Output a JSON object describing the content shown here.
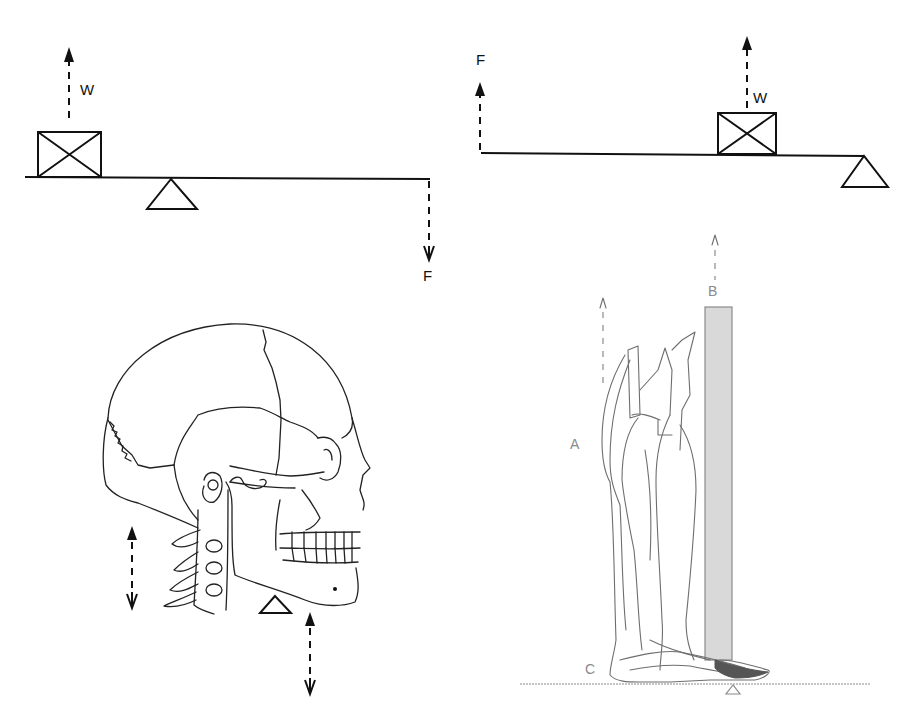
{
  "lever_first_class": {
    "title": "First-class lever",
    "load_label": "W",
    "effort_label": "F",
    "load_arrow": "up",
    "effort_arrow": "down",
    "fulcrum": "between load and effort"
  },
  "lever_second_class": {
    "title": "Second-class lever",
    "effort_label": "F",
    "load_label": "W",
    "effort_arrow": "up",
    "load_arrow": "up",
    "fulcrum": "at right end"
  },
  "skull_example": {
    "title": "Head balanced on atlas (first-class lever)",
    "left_arrow": "bidirectional",
    "right_arrow": "bidirectional",
    "fulcrum": "below jaw"
  },
  "leg_example": {
    "title": "Foot raised on toes (second-class lever)",
    "label_a": "A",
    "label_b": "B",
    "label_c": "C",
    "bar_color": "#d9d9d9",
    "fulcrum": "under ball of foot"
  }
}
